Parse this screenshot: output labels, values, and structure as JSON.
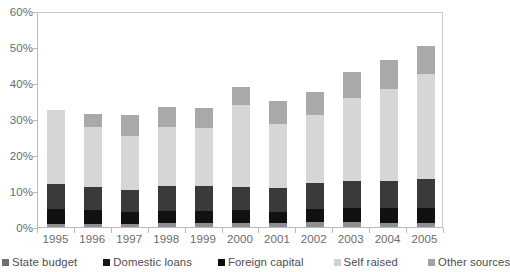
{
  "chart_data": {
    "type": "bar",
    "title": "",
    "xlabel": "",
    "ylabel": "",
    "ylim": [
      0,
      60
    ],
    "ytick_labels": [
      "0%",
      "10%",
      "20%",
      "30%",
      "40%",
      "50%",
      "60%"
    ],
    "ytick_values": [
      0,
      10,
      20,
      30,
      40,
      50,
      60
    ],
    "grid": false,
    "stacked": true,
    "legend_position": "bottom",
    "categories": [
      "1995",
      "1996",
      "1997",
      "1998",
      "1999",
      "2000",
      "2001",
      "2002",
      "2003",
      "2004",
      "2005"
    ],
    "series": [
      {
        "name": "State budget",
        "color": "#3a3a3c",
        "values": [
          7.0,
          6.6,
          6.3,
          7.0,
          6.8,
          6.5,
          6.5,
          7.2,
          7.5,
          7.5,
          7.8
        ]
      },
      {
        "name": "Domestic loans",
        "color": "#111113",
        "values": [
          4.2,
          3.8,
          3.2,
          3.4,
          3.5,
          3.6,
          3.2,
          3.6,
          4.0,
          4.0,
          4.2
        ]
      },
      {
        "name": "Foreign capital",
        "color": "#8e8e90",
        "values": [
          0.7,
          0.8,
          0.9,
          1.0,
          1.0,
          1.1,
          1.1,
          1.3,
          1.3,
          1.2,
          1.2
        ]
      },
      {
        "name": "Self raised",
        "color": "#d6d6d4",
        "values": [
          20.6,
          16.6,
          15.0,
          16.4,
          16.2,
          22.6,
          17.8,
          19.1,
          23.0,
          25.5,
          29.2
        ]
      },
      {
        "name": "Other sources",
        "color": "#a9a9a8",
        "values": [
          0.0,
          3.7,
          5.6,
          5.4,
          5.5,
          5.2,
          6.4,
          6.3,
          7.2,
          8.3,
          7.8
        ]
      }
    ],
    "totals": [
      32.5,
      31.5,
      31.0,
      33.2,
      33.0,
      39.0,
      35.0,
      37.5,
      43.0,
      46.5,
      50.2
    ]
  },
  "legend": {
    "items": [
      {
        "label": "State budget",
        "color": "#6f6f71"
      },
      {
        "label": "Domestic loans",
        "color": "#171719"
      },
      {
        "label": "Foreign capital",
        "color": "#0d0d0f"
      },
      {
        "label": "Self raised",
        "color": "#d2d2d0"
      },
      {
        "label": "Other sources",
        "color": "#a3a3a2"
      }
    ]
  }
}
